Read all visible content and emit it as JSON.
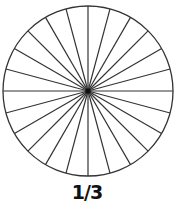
{
  "diagram": {
    "type": "divided-circle",
    "sectors": 24,
    "sector_angle_degrees": 15,
    "caption": "1/3",
    "stroke_color": "#333333",
    "fill_color": "#ffffff"
  }
}
